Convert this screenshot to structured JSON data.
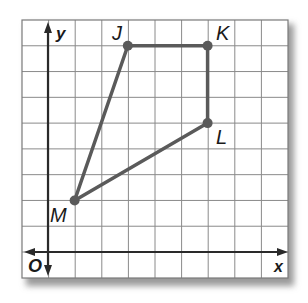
{
  "diagram": {
    "type": "coordinate-plane-polygon",
    "axes": {
      "x_label": "x",
      "y_label": "y",
      "origin_label": "O"
    },
    "grid": {
      "columns": 10,
      "rows": 10,
      "x_range": [
        -1,
        9
      ],
      "y_range": [
        -1,
        9
      ]
    },
    "points": [
      {
        "name": "J",
        "x": 3,
        "y": 8
      },
      {
        "name": "K",
        "x": 6,
        "y": 8
      },
      {
        "name": "L",
        "x": 6,
        "y": 5
      },
      {
        "name": "M",
        "x": 1,
        "y": 2
      }
    ],
    "polygon_order": [
      "J",
      "K",
      "L",
      "M"
    ],
    "colors": {
      "grid": "#8a8a8a",
      "axis": "#2a2a2a",
      "polygon": "#5a5a5a",
      "label": "#1a1a1a",
      "shadow": "#b0b0b0"
    }
  }
}
